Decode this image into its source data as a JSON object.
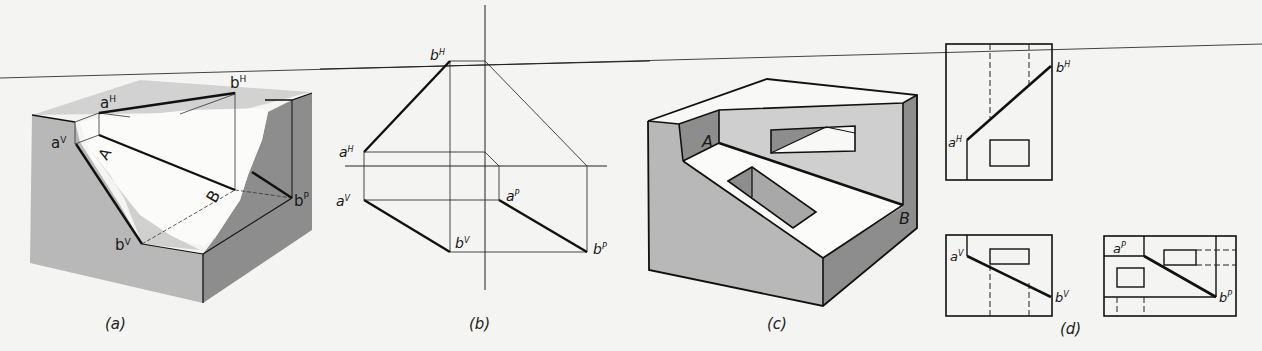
{
  "figure": {
    "colors": {
      "background": "#f4f4f2",
      "face_light": "#b8b8b8",
      "face_dark": "#8d8d8d",
      "face_top": "#d2d2d2",
      "line": "#111111",
      "thin_line": "#333333"
    },
    "rule_line": {
      "present": true
    }
  },
  "panels": [
    {
      "id": "a",
      "caption": "(a)",
      "description": "Cutaway isometric box showing line AB and its projections",
      "labels": {
        "aH": {
          "base": "a",
          "sup": "H"
        },
        "bH": {
          "base": "b",
          "sup": "H"
        },
        "aV": {
          "base": "a",
          "sup": "V"
        },
        "bV": {
          "base": "b",
          "sup": "V"
        },
        "bP": {
          "base": "b",
          "sup": "P"
        },
        "A": "A",
        "B": "B"
      }
    },
    {
      "id": "b",
      "caption": "(b)",
      "description": "Orthographic projection of line AB in horizontal, vertical and profile planes",
      "labels": {
        "aH": {
          "base": "a",
          "sup": "H"
        },
        "bH": {
          "base": "b",
          "sup": "H"
        },
        "aV": {
          "base": "a",
          "sup": "V"
        },
        "bV": {
          "base": "b",
          "sup": "V"
        },
        "aP": {
          "base": "a",
          "sup": "P"
        },
        "bP": {
          "base": "b",
          "sup": "P"
        }
      }
    },
    {
      "id": "c",
      "caption": "(c)",
      "description": "Isometric block with sloped cut; edge AB with rectangular openings",
      "labels": {
        "A": "A",
        "B": "B"
      }
    },
    {
      "id": "d",
      "caption": "(d)",
      "description": "Three orthographic views of block in (c) with line AB",
      "views": [
        {
          "name": "top",
          "labels": {
            "aH": {
              "base": "a",
              "sup": "H"
            },
            "bH": {
              "base": "b",
              "sup": "H"
            }
          }
        },
        {
          "name": "front",
          "labels": {
            "aV": {
              "base": "a",
              "sup": "V"
            },
            "bV": {
              "base": "b",
              "sup": "V"
            }
          }
        },
        {
          "name": "side",
          "labels": {
            "aP": {
              "base": "a",
              "sup": "P"
            },
            "bP": {
              "base": "b",
              "sup": "P"
            }
          }
        }
      ]
    }
  ]
}
